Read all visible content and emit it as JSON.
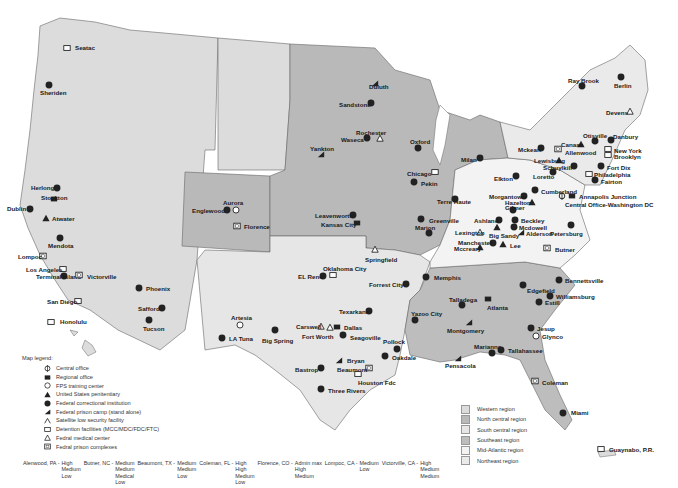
{
  "map": {
    "title": "Federal Bureau of Prisons facilities map",
    "region_colors": {
      "western": "#dcdcdc",
      "north_central": "#b9b9b9",
      "south_central": "#e6e6e6",
      "southeast": "#bdbdbd",
      "mid_atlantic": "#f3f3f3",
      "northeast": "#eaeaea"
    },
    "facilities": [
      {
        "name": "Seatac",
        "icon": "detention-icon",
        "x": 67,
        "y": 48,
        "lx": 75,
        "ly": 45
      },
      {
        "name": "Sheriden",
        "icon": "fci-icon",
        "x": 49,
        "y": 85,
        "lx": 40,
        "ly": 90
      },
      {
        "name": "Herlong",
        "icon": "fci-icon",
        "x": 57,
        "y": 188,
        "lx": 31,
        "ly": 185
      },
      {
        "name": "Stockton",
        "icon": "regional-office-icon",
        "x": 54,
        "y": 199,
        "lx": 41,
        "ly": 195
      },
      {
        "name": "Dublin",
        "icon": "fci-icon",
        "x": 30,
        "y": 209,
        "lx": 7,
        "ly": 206
      },
      {
        "name": "Atwater",
        "icon": "usp-icon",
        "x": 46,
        "y": 218,
        "lx": 52,
        "ly": 216
      },
      {
        "name": "Mendota",
        "icon": "fci-icon",
        "x": 60,
        "y": 238,
        "lx": 48,
        "ly": 243
      },
      {
        "name": "Lompoc",
        "icon": "complex-icon",
        "x": 43,
        "y": 256,
        "lx": 18,
        "ly": 254
      },
      {
        "name": "Los Angeles",
        "icon": "detention-icon",
        "x": 63,
        "y": 269,
        "lx": 26,
        "ly": 267
      },
      {
        "name": "Terminal Island",
        "icon": "fci-icon",
        "x": 64,
        "y": 276,
        "lx": 36,
        "ly": 274
      },
      {
        "name": "Victorville",
        "icon": "complex-icon",
        "x": 79,
        "y": 275,
        "lx": 87,
        "ly": 274
      },
      {
        "name": "San Diego",
        "icon": "detention-icon",
        "x": 78,
        "y": 301,
        "lx": 47,
        "ly": 299
      },
      {
        "name": "Honolulu",
        "icon": "detention-icon",
        "x": 51,
        "y": 322,
        "lx": 60,
        "ly": 319
      },
      {
        "name": "Phoenix",
        "icon": "fci-icon",
        "x": 139,
        "y": 288,
        "lx": 146,
        "ly": 286
      },
      {
        "name": "Safford",
        "icon": "fci-icon",
        "x": 162,
        "y": 308,
        "lx": 138,
        "ly": 306
      },
      {
        "name": "Tucson",
        "icon": "fci-icon",
        "x": 149,
        "y": 320,
        "lx": 143,
        "ly": 326
      },
      {
        "name": "Aurora",
        "icon": "training-center-icon",
        "x": 236,
        "y": 210,
        "lx": 223,
        "ly": 200
      },
      {
        "name": "Englewood",
        "icon": "fci-icon",
        "x": 227,
        "y": 210,
        "lx": 192,
        "ly": 208
      },
      {
        "name": "Florence",
        "icon": "complex-icon",
        "x": 237,
        "y": 226,
        "lx": 244,
        "ly": 224
      },
      {
        "name": "Leavenworth",
        "icon": "fci-icon",
        "x": 353,
        "y": 215,
        "lx": 315,
        "ly": 213
      },
      {
        "name": "Kansas City",
        "icon": "regional-office-icon",
        "x": 357,
        "y": 223,
        "lx": 321,
        "ly": 222
      },
      {
        "name": "Oklahoma City",
        "icon": "detention-icon",
        "x": 333,
        "y": 275,
        "lx": 323,
        "ly": 266
      },
      {
        "name": "EL Reno",
        "icon": "fci-icon",
        "x": 323,
        "y": 276,
        "lx": 298,
        "ly": 274
      },
      {
        "name": "Artesia",
        "icon": "training-center-icon",
        "x": 240,
        "y": 325,
        "lx": 231,
        "ly": 315
      },
      {
        "name": "LA Tuna",
        "icon": "fci-icon",
        "x": 222,
        "y": 338,
        "lx": 229,
        "ly": 336
      },
      {
        "name": "Big Spring",
        "icon": "fci-icon",
        "x": 275,
        "y": 330,
        "lx": 262,
        "ly": 338
      },
      {
        "name": "Carswell",
        "icon": "medical-center-icon",
        "x": 321,
        "y": 326,
        "lx": 296,
        "ly": 324
      },
      {
        "name": "Fort Worth",
        "icon": "medical-center-icon",
        "x": 330,
        "y": 327,
        "lx": 302,
        "ly": 334
      },
      {
        "name": "Dallas",
        "icon": "regional-office-icon",
        "x": 337,
        "y": 327,
        "lx": 344,
        "ly": 325
      },
      {
        "name": "Seagoville",
        "icon": "fci-icon",
        "x": 343,
        "y": 335,
        "lx": 350,
        "ly": 335
      },
      {
        "name": "Texarkana",
        "icon": "fci-icon",
        "x": 369,
        "y": 311,
        "lx": 339,
        "ly": 309
      },
      {
        "name": "Bryan",
        "icon": "prison-camp-icon",
        "x": 339,
        "y": 360,
        "lx": 347,
        "ly": 358
      },
      {
        "name": "Bastrop",
        "icon": "fci-icon",
        "x": 321,
        "y": 368,
        "lx": 295,
        "ly": 367
      },
      {
        "name": "Beaumont",
        "icon": "complex-icon",
        "x": 369,
        "y": 368,
        "lx": 337,
        "ly": 367
      },
      {
        "name": "Houston Fdc",
        "icon": "detention-icon",
        "x": 358,
        "y": 374,
        "lx": 358,
        "ly": 380
      },
      {
        "name": "Three Rivers",
        "icon": "fci-icon",
        "x": 321,
        "y": 389,
        "lx": 328,
        "ly": 388
      },
      {
        "name": "Pollock",
        "icon": "fci-icon",
        "x": 397,
        "y": 349,
        "lx": 383,
        "ly": 339
      },
      {
        "name": "Oakdale",
        "icon": "fci-icon",
        "x": 385,
        "y": 356,
        "lx": 392,
        "ly": 355
      },
      {
        "name": "Forrest City",
        "icon": "fci-icon",
        "x": 406,
        "y": 284,
        "lx": 369,
        "ly": 282
      },
      {
        "name": "Memphis",
        "icon": "fci-icon",
        "x": 426,
        "y": 277,
        "lx": 434,
        "ly": 275
      },
      {
        "name": "Yazoo City",
        "icon": "fci-icon",
        "x": 415,
        "y": 320,
        "lx": 411,
        "ly": 311
      },
      {
        "name": "Springfield",
        "icon": "medical-center-icon",
        "x": 375,
        "y": 249,
        "lx": 365,
        "ly": 257
      },
      {
        "name": "Duluth",
        "icon": "prison-camp-icon",
        "x": 375,
        "y": 83,
        "lx": 369,
        "ly": 84
      },
      {
        "name": "Sandstone",
        "icon": "fci-icon",
        "x": 371,
        "y": 103,
        "lx": 339,
        "ly": 102
      },
      {
        "name": "Rochester",
        "icon": "medical-center-icon",
        "x": 380,
        "y": 138,
        "lx": 356,
        "ly": 130
      },
      {
        "name": "Waseca",
        "icon": "fci-icon",
        "x": 367,
        "y": 138,
        "lx": 341,
        "ly": 137
      },
      {
        "name": "Yankton",
        "icon": "prison-camp-icon",
        "x": 321,
        "y": 154,
        "lx": 310,
        "ly": 146
      },
      {
        "name": "Oxford",
        "icon": "fci-icon",
        "x": 418,
        "y": 148,
        "lx": 410,
        "ly": 139
      },
      {
        "name": "Milan",
        "icon": "fci-icon",
        "x": 480,
        "y": 158,
        "lx": 461,
        "ly": 157
      },
      {
        "name": "Chicago",
        "icon": "detention-icon",
        "x": 435,
        "y": 172,
        "lx": 407,
        "ly": 171
      },
      {
        "name": "Pekin",
        "icon": "fci-icon",
        "x": 414,
        "y": 182,
        "lx": 421,
        "ly": 181
      },
      {
        "name": "Terre Haute",
        "icon": "fci-icon",
        "x": 455,
        "y": 199,
        "lx": 437,
        "ly": 199
      },
      {
        "name": "Greenville",
        "icon": "fci-icon",
        "x": 421,
        "y": 219,
        "lx": 429,
        "ly": 218
      },
      {
        "name": "Marion",
        "icon": "fci-icon",
        "x": 429,
        "y": 233,
        "lx": 415,
        "ly": 225
      },
      {
        "name": "Elkton",
        "icon": "fci-icon",
        "x": 516,
        "y": 176,
        "lx": 494,
        "ly": 176
      },
      {
        "name": "Ashland",
        "icon": "fci-icon",
        "x": 499,
        "y": 220,
        "lx": 474,
        "ly": 218
      },
      {
        "name": "Lexington",
        "icon": "medical-center-icon",
        "x": 480,
        "y": 232,
        "lx": 455,
        "ly": 230
      },
      {
        "name": "Big Sandy",
        "icon": "usp-icon",
        "x": 497,
        "y": 227,
        "lx": 489,
        "ly": 233
      },
      {
        "name": "Manchester",
        "icon": "fci-icon",
        "x": 493,
        "y": 243,
        "lx": 458,
        "ly": 240
      },
      {
        "name": "Mccreary",
        "icon": "usp-icon",
        "x": 480,
        "y": 247,
        "lx": 454,
        "ly": 246
      },
      {
        "name": "Lee",
        "icon": "usp-icon",
        "x": 503,
        "y": 244,
        "lx": 510,
        "ly": 243
      },
      {
        "name": "Gilmer",
        "icon": "fci-icon",
        "x": 513,
        "y": 210,
        "lx": 505,
        "ly": 205
      },
      {
        "name": "Beckley",
        "icon": "fci-icon",
        "x": 515,
        "y": 220,
        "lx": 521,
        "ly": 218
      },
      {
        "name": "Mcdowell",
        "icon": "fci-icon",
        "x": 514,
        "y": 227,
        "lx": 519,
        "ly": 225
      },
      {
        "name": "Alderson",
        "icon": "prison-camp-icon",
        "x": 521,
        "y": 232,
        "lx": 526,
        "ly": 231
      },
      {
        "name": "Morgantown",
        "icon": "fci-icon",
        "x": 524,
        "y": 196,
        "lx": 489,
        "ly": 194
      },
      {
        "name": "Hazelton",
        "icon": "usp-icon",
        "x": 532,
        "y": 202,
        "lx": 505,
        "ly": 200
      },
      {
        "name": "Cumberland",
        "icon": "fci-icon",
        "x": 535,
        "y": 190,
        "lx": 541,
        "ly": 189
      },
      {
        "name": "Annapolis Junction",
        "icon": "regional-office-icon",
        "x": 572,
        "y": 196,
        "lx": 579,
        "ly": 194
      },
      {
        "name": "Central Office-Washington DC",
        "icon": "central-office-icon",
        "x": 562,
        "y": 196,
        "lx": 565,
        "ly": 202
      },
      {
        "name": "Petersburg",
        "icon": "fci-icon",
        "x": 571,
        "y": 225,
        "lx": 550,
        "ly": 231
      },
      {
        "name": "Butner",
        "icon": "complex-icon",
        "x": 547,
        "y": 248,
        "lx": 555,
        "ly": 247
      },
      {
        "name": "Ray Brook",
        "icon": "fci-icon",
        "x": 582,
        "y": 86,
        "lx": 568,
        "ly": 78
      },
      {
        "name": "Berlin",
        "icon": "fci-icon",
        "x": 621,
        "y": 77,
        "lx": 614,
        "ly": 83
      },
      {
        "name": "Devens",
        "icon": "medical-center-icon",
        "x": 630,
        "y": 111,
        "lx": 606,
        "ly": 110
      },
      {
        "name": "Otisville",
        "icon": "fci-icon",
        "x": 595,
        "y": 141,
        "lx": 583,
        "ly": 133
      },
      {
        "name": "Danbury",
        "icon": "fci-icon",
        "x": 611,
        "y": 140,
        "lx": 613,
        "ly": 134
      },
      {
        "name": "Canaan",
        "icon": "usp-icon",
        "x": 581,
        "y": 144,
        "lx": 561,
        "ly": 142
      },
      {
        "name": "Allenwood",
        "icon": "complex-icon",
        "x": 558,
        "y": 149,
        "lx": 565,
        "ly": 150
      },
      {
        "name": "Mckean",
        "icon": "fci-icon",
        "x": 541,
        "y": 148,
        "lx": 518,
        "ly": 147
      },
      {
        "name": "New York",
        "icon": "detention-icon",
        "x": 608,
        "y": 149,
        "lx": 614,
        "ly": 148
      },
      {
        "name": "Brooklyn",
        "icon": "detention-icon",
        "x": 608,
        "y": 155,
        "lx": 614,
        "ly": 154
      },
      {
        "name": "Lewisburg",
        "icon": "usp-icon",
        "x": 559,
        "y": 160,
        "lx": 534,
        "ly": 158
      },
      {
        "name": "Schuylkill",
        "icon": "fci-icon",
        "x": 574,
        "y": 166,
        "lx": 543,
        "ly": 165
      },
      {
        "name": "Fort Dix",
        "icon": "fci-icon",
        "x": 601,
        "y": 166,
        "lx": 607,
        "ly": 165
      },
      {
        "name": "Loretto",
        "icon": "fci-icon",
        "x": 553,
        "y": 172,
        "lx": 533,
        "ly": 174
      },
      {
        "name": "Philadelphia",
        "icon": "detention-icon",
        "x": 589,
        "y": 174,
        "lx": 594,
        "ly": 172
      },
      {
        "name": "Fairton",
        "icon": "fci-icon",
        "x": 595,
        "y": 180,
        "lx": 601,
        "ly": 179
      },
      {
        "name": "Bennettsville",
        "icon": "fci-icon",
        "x": 559,
        "y": 280,
        "lx": 565,
        "ly": 278
      },
      {
        "name": "Edgefield",
        "icon": "fci-icon",
        "x": 523,
        "y": 285,
        "lx": 527,
        "ly": 288
      },
      {
        "name": "Williamsburg",
        "icon": "fci-icon",
        "x": 550,
        "y": 296,
        "lx": 556,
        "ly": 294
      },
      {
        "name": "Estill",
        "icon": "fci-icon",
        "x": 539,
        "y": 302,
        "lx": 545,
        "ly": 300
      },
      {
        "name": "Talladega",
        "icon": "fci-icon",
        "x": 462,
        "y": 305,
        "lx": 449,
        "ly": 297
      },
      {
        "name": "Atlanta",
        "icon": "regional-office-icon",
        "x": 488,
        "y": 299,
        "lx": 487,
        "ly": 305
      },
      {
        "name": "Montgomery",
        "icon": "prison-camp-icon",
        "x": 469,
        "y": 322,
        "lx": 447,
        "ly": 328
      },
      {
        "name": "Jesup",
        "icon": "fci-icon",
        "x": 531,
        "y": 328,
        "lx": 537,
        "ly": 326
      },
      {
        "name": "Glynco",
        "icon": "training-center-icon",
        "x": 536,
        "y": 336,
        "lx": 542,
        "ly": 334
      },
      {
        "name": "Marianna",
        "icon": "fci-icon",
        "x": 492,
        "y": 353,
        "lx": 474,
        "ly": 344
      },
      {
        "name": "Tallahassee",
        "icon": "fci-icon",
        "x": 501,
        "y": 350,
        "lx": 508,
        "ly": 348
      },
      {
        "name": "Pensacola",
        "icon": "prison-camp-icon",
        "x": 458,
        "y": 358,
        "lx": 445,
        "ly": 363
      },
      {
        "name": "Coleman",
        "icon": "complex-icon",
        "x": 535,
        "y": 381,
        "lx": 542,
        "ly": 380
      },
      {
        "name": "Miami",
        "icon": "fci-icon",
        "x": 563,
        "y": 413,
        "lx": 571,
        "ly": 410
      },
      {
        "name": "Guaynabo, P.R.",
        "icon": "detention-icon",
        "x": 601,
        "y": 449,
        "lx": 609,
        "ly": 447
      }
    ]
  },
  "legend": {
    "title": "Map legend:",
    "items": [
      {
        "icon": "central-office-icon",
        "label": "Central office"
      },
      {
        "icon": "regional-office-icon",
        "label": "Regional office"
      },
      {
        "icon": "training-center-icon",
        "label": "FPS training center"
      },
      {
        "icon": "usp-icon",
        "label": "United States penitentiary"
      },
      {
        "icon": "fci-icon",
        "label": "Federal correctional institution"
      },
      {
        "icon": "prison-camp-icon",
        "label": "Federal prison camp (stand alone)"
      },
      {
        "icon": "satellite-icon",
        "label": "Satellite low security facility"
      },
      {
        "icon": "detention-icon",
        "label": "Detention facilities (MCC/MDC/FDC/FTC)"
      },
      {
        "icon": "medical-center-icon",
        "label": "Fedral medical center"
      },
      {
        "icon": "complex-icon",
        "label": "Fedral prison complexes"
      }
    ]
  },
  "regions_legend": [
    {
      "label": "Western region",
      "color": "#dcdcdc"
    },
    {
      "label": "North central region",
      "color": "#b9b9b9"
    },
    {
      "label": "South central region",
      "color": "#e6e6e6"
    },
    {
      "label": "Southeast region",
      "color": "#bdbdbd"
    },
    {
      "label": "Mid-Atlantic region",
      "color": "#f3f3f3"
    },
    {
      "label": "Northeast region",
      "color": "#eaeaea"
    }
  ],
  "complexes": [
    {
      "name": "Alenwood, PA -",
      "levels": [
        "High",
        "Medium",
        "Low"
      ]
    },
    {
      "name": "Butner, NC -",
      "levels": [
        "Medium",
        "Medium",
        "Medical",
        "Low"
      ]
    },
    {
      "name": "Beaumont, TX -",
      "levels": [
        "Medium",
        "Medium",
        "Low"
      ]
    },
    {
      "name": "Coleman, FL -",
      "levels": [
        "High",
        "High",
        "Medium",
        "Low"
      ]
    },
    {
      "name": "Florence, CO -",
      "levels": [
        "Admin max",
        "High",
        "Medium"
      ]
    },
    {
      "name": "Lompoc, CA -",
      "levels": [
        "Medium",
        "Low"
      ]
    },
    {
      "name": "Victorville, CA -",
      "levels": [
        "High",
        "Medium",
        "Medium"
      ]
    }
  ]
}
